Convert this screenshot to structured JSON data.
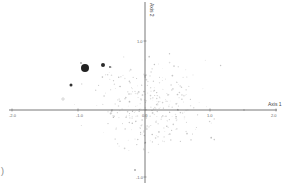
{
  "chart_data": {
    "type": "scatter",
    "title": "",
    "xlabel": "Axis 1",
    "ylabel": "Axis 2",
    "xlim": [
      -2.0,
      2.0
    ],
    "ylim": [
      -1.0,
      1.0
    ],
    "x_ticks": [
      "-2.0",
      "-1.0",
      "0.0",
      "1.0",
      "2.0"
    ],
    "y_ticks": [
      "1.0",
      "-1.0"
    ],
    "grid": false,
    "legend": null,
    "colors": {
      "axis": "#555555",
      "highlight_points": "#222222",
      "faint_points": "#cccccc"
    },
    "highlight_points": [
      {
        "x": -0.88,
        "y": 0.63,
        "size": "large"
      },
      {
        "x": -0.62,
        "y": 0.66,
        "size": "medium"
      },
      {
        "x": -1.1,
        "y": 0.36,
        "size": "small"
      },
      {
        "x": -0.53,
        "y": 0.63,
        "size": "tiny"
      },
      {
        "x": -0.94,
        "y": 0.69,
        "size": "tiny"
      },
      {
        "x": -0.14,
        "y": -0.89,
        "size": "tiny"
      }
    ],
    "faint_points_note": "Several hundred faint light-gray points scattered mostly between x -1.5 and 1.2, y -1.0 and 1.1"
  },
  "stray_text": ")"
}
